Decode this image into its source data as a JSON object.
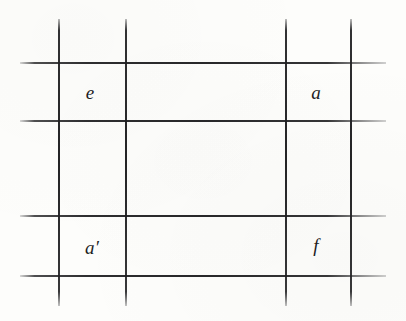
{
  "figure": {
    "kind": "grid-diagram",
    "background_color": "#fdfdfb",
    "line_color": "#1e1e20",
    "canvas": {
      "width": 406,
      "height": 321
    }
  },
  "grid": {
    "vertical_lines": [
      {
        "name": "vline-1",
        "x": 58,
        "y_start": 19,
        "y_end": 306
      },
      {
        "name": "vline-2",
        "x": 125,
        "y_start": 19,
        "y_end": 306
      },
      {
        "name": "vline-3",
        "x": 285,
        "y_start": 19,
        "y_end": 306
      },
      {
        "name": "vline-4",
        "x": 350,
        "y_start": 19,
        "y_end": 306
      }
    ],
    "horizontal_lines": [
      {
        "name": "hline-1",
        "y": 62,
        "x_start": 20,
        "x_end": 386
      },
      {
        "name": "hline-2",
        "y": 120,
        "x_start": 20,
        "x_end": 386
      },
      {
        "name": "hline-3",
        "y": 215,
        "x_start": 20,
        "x_end": 386
      },
      {
        "name": "hline-4",
        "y": 275,
        "x_start": 20,
        "x_end": 386
      }
    ]
  },
  "labels": [
    {
      "id": "label-e",
      "text": "e",
      "x": 90,
      "y": 92,
      "cell": "top-left"
    },
    {
      "id": "label-a",
      "text": "a",
      "x": 316,
      "y": 92,
      "cell": "top-right"
    },
    {
      "id": "label-a-prime",
      "text": "a′",
      "x": 92,
      "y": 247,
      "cell": "bottom-left"
    },
    {
      "id": "label-f",
      "text": "f",
      "x": 316,
      "y": 245,
      "cell": "bottom-right"
    }
  ]
}
